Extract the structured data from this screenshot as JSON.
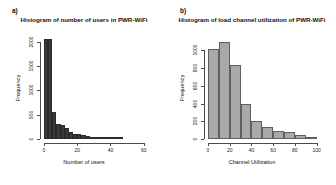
{
  "figure": {
    "background": "#ffffff",
    "panels": [
      {
        "tag": "a)",
        "title": "Histogram of number of users in PWR-WiFi"
      },
      {
        "tag": "b)",
        "title": "Histogram of load channel utilization of PWR-WiFi"
      }
    ]
  },
  "chart_data": [
    {
      "type": "bar",
      "title": "Histogram of number of users in PWR-WiFi",
      "panel": "a)",
      "xlabel": "Number of users",
      "ylabel": "Frequency",
      "xlim": [
        0,
        65
      ],
      "ylim": [
        0,
        2100
      ],
      "xticks": [
        0,
        20,
        40,
        60
      ],
      "xticklabels": [
        "0",
        "20",
        "40",
        "60"
      ],
      "yticks": [
        0,
        500,
        1000,
        1500,
        2000
      ],
      "yticklabels": [
        "0",
        "500",
        "1000",
        "1500",
        "2000"
      ],
      "grid": false,
      "legend": null,
      "bar_color": "#3b3b3b",
      "bin_width": 2.5,
      "bin_edges": [
        0,
        2.5,
        5,
        7.5,
        10,
        12.5,
        15,
        17.5,
        20,
        22.5,
        25,
        27.5,
        30,
        32.5,
        35,
        37.5,
        40,
        42.5,
        45,
        47.5,
        50,
        52.5,
        55,
        57.5,
        60,
        62.5,
        65
      ],
      "categories": [
        "0-2.5",
        "2.5-5",
        "5-7.5",
        "7.5-10",
        "10-12.5",
        "12.5-15",
        "15-17.5",
        "17.5-20",
        "20-22.5",
        "22.5-25",
        "25-27.5",
        "27.5-30",
        "30-32.5",
        "32.5-35",
        "35-37.5",
        "37.5-40",
        "40-42.5",
        "42.5-45",
        "45-47.5",
        "47.5-50",
        "50-52.5",
        "52.5-55",
        "55-57.5",
        "57.5-60",
        "60-62.5",
        "62.5-65"
      ],
      "values": [
        2050,
        2050,
        560,
        300,
        280,
        230,
        150,
        110,
        95,
        80,
        60,
        45,
        35,
        30,
        25,
        22,
        18,
        12,
        5,
        0,
        0,
        0,
        0,
        0,
        0,
        0
      ]
    },
    {
      "type": "bar",
      "title": "Histogram of load channel utilization of PWR-WiFi",
      "panel": "b)",
      "xlabel": "Channel Utilization",
      "ylabel": "Frequency",
      "xlim": [
        0,
        105
      ],
      "ylim": [
        0,
        1150
      ],
      "xticks": [
        0,
        20,
        40,
        60,
        80,
        100
      ],
      "xticklabels": [
        "0",
        "20",
        "40",
        "60",
        "80",
        "100"
      ],
      "yticks": [
        0,
        200,
        400,
        600,
        800,
        1000
      ],
      "yticklabels": [
        "0",
        "200",
        "400",
        "600",
        "800",
        "1000"
      ],
      "grid": false,
      "legend": null,
      "bar_color": "#a9a9a9",
      "bar_edge_color": "#5f5f5f",
      "bin_width": 10,
      "bin_edges": [
        0,
        10,
        20,
        30,
        40,
        50,
        60,
        70,
        80,
        90,
        100
      ],
      "categories": [
        "0-10",
        "10-20",
        "20-30",
        "30-40",
        "40-50",
        "50-60",
        "60-70",
        "70-80",
        "80-90",
        "90-100"
      ],
      "values": [
        1020,
        1090,
        830,
        390,
        200,
        140,
        95,
        80,
        40,
        15
      ]
    }
  ]
}
